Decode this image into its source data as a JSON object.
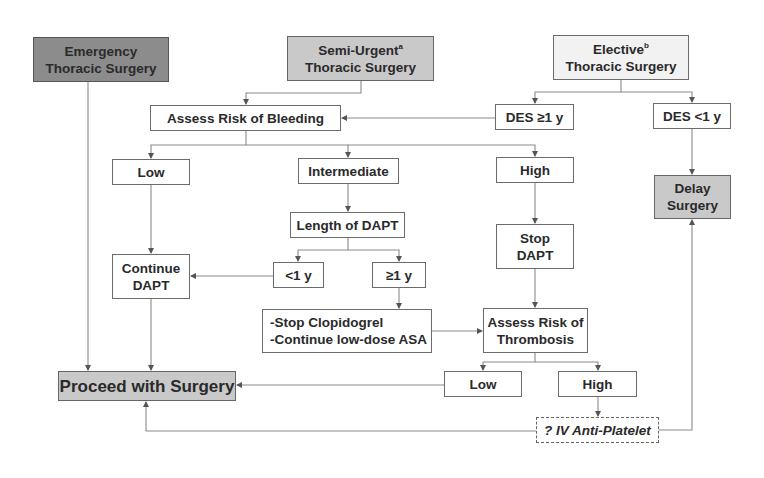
{
  "diagram": {
    "type": "flowchart",
    "colors": {
      "emergency_fill": "#8c8c8c",
      "semi_urgent_fill": "#c9c9c9",
      "elective_fill": "#f2f2f2",
      "outcome_fill": "#c9c9c9",
      "line": "#8a8a8a",
      "border": "#6b6b6b"
    },
    "nodes": {
      "emergency": {
        "line1": "Emergency",
        "line2": "Thoracic Surgery"
      },
      "semi_urgent": {
        "line1": "Semi-Urgent",
        "sup": "a",
        "line2": "Thoracic Surgery"
      },
      "elective": {
        "line1": "Elective",
        "sup": "b",
        "line2": "Thoracic Surgery"
      },
      "assess_bleeding": "Assess Risk of Bleeding",
      "des_ge_1y": "DES ≥1 y",
      "des_lt_1y": "DES <1 y",
      "bleed_low": "Low",
      "bleed_intermediate": "Intermediate",
      "bleed_high": "High",
      "delay_surgery": "Delay\nSurgery",
      "length_dapt": "Length of DAPT",
      "stop_dapt": "Stop\nDAPT",
      "continue_dapt": "Continue\nDAPT",
      "dapt_lt_1y": "<1 y",
      "dapt_ge_1y": "≥1 y",
      "stop_clopidogrel": "-Stop Clopidogrel\n-Continue low-dose ASA",
      "assess_thrombosis": "Assess Risk of\nThrombosis",
      "proceed_surgery": "Proceed with Surgery",
      "thromb_low": "Low",
      "thromb_high": "High",
      "iv_antiplatelet": "? IV Anti-Platelet"
    },
    "edges": [
      [
        "emergency",
        "proceed_surgery"
      ],
      [
        "semi_urgent",
        "assess_bleeding"
      ],
      [
        "elective",
        "des_ge_1y"
      ],
      [
        "elective",
        "des_lt_1y"
      ],
      [
        "des_ge_1y",
        "assess_bleeding"
      ],
      [
        "des_lt_1y",
        "delay_surgery"
      ],
      [
        "assess_bleeding",
        "bleed_low"
      ],
      [
        "assess_bleeding",
        "bleed_intermediate"
      ],
      [
        "assess_bleeding",
        "bleed_high"
      ],
      [
        "bleed_low",
        "continue_dapt"
      ],
      [
        "bleed_intermediate",
        "length_dapt"
      ],
      [
        "bleed_high",
        "stop_dapt"
      ],
      [
        "length_dapt",
        "dapt_lt_1y"
      ],
      [
        "length_dapt",
        "dapt_ge_1y"
      ],
      [
        "dapt_lt_1y",
        "continue_dapt"
      ],
      [
        "dapt_ge_1y",
        "stop_clopidogrel"
      ],
      [
        "stop_clopidogrel",
        "assess_thrombosis"
      ],
      [
        "stop_dapt",
        "assess_thrombosis"
      ],
      [
        "continue_dapt",
        "proceed_surgery"
      ],
      [
        "assess_thrombosis",
        "thromb_low"
      ],
      [
        "assess_thrombosis",
        "thromb_high"
      ],
      [
        "thromb_low",
        "proceed_surgery"
      ],
      [
        "thromb_high",
        "iv_antiplatelet"
      ],
      [
        "iv_antiplatelet",
        "proceed_surgery"
      ],
      [
        "iv_antiplatelet",
        "delay_surgery"
      ]
    ]
  }
}
